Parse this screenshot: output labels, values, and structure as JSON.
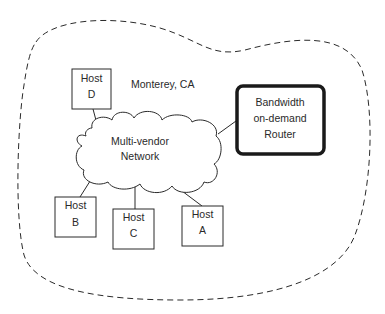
{
  "diagram": {
    "region_label": "Monterey, CA",
    "network": {
      "line1": "Multi-vendor",
      "line2": "Network"
    },
    "router": {
      "line1": "Bandwidth",
      "line2": "on-demand",
      "line3": "Router"
    },
    "hosts": [
      {
        "id": "D",
        "line1": "Host",
        "line2": "D"
      },
      {
        "id": "B",
        "line1": "Host",
        "line2": "B"
      },
      {
        "id": "C",
        "line1": "Host",
        "line2": "C"
      },
      {
        "id": "A",
        "line1": "Host",
        "line2": "A"
      }
    ],
    "colors": {
      "stroke": "#2a2a2a",
      "background": "#ffffff"
    }
  }
}
